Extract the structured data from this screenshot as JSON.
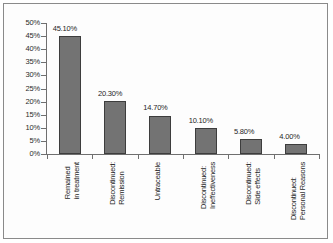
{
  "chart_data": {
    "type": "bar",
    "title": "",
    "subtitle": "",
    "xlabel": "",
    "ylabel": "",
    "ylim": [
      0,
      50
    ],
    "ytick_values": [
      0,
      5,
      10,
      15,
      20,
      25,
      30,
      35,
      40,
      45,
      50
    ],
    "ytick_labels": [
      "0%",
      "5%",
      "10%",
      "15%",
      "20%",
      "25%",
      "30%",
      "35%",
      "40%",
      "45%",
      "50%"
    ],
    "grid": false,
    "legend": "none",
    "bar_color": "#737373",
    "bar_border_color": "#3d3d3d",
    "axis_color": "#6f6f6f",
    "categories": [
      "Remained in treatment",
      "Discontinued: Remission",
      "Untraceable",
      "Discontinued: Ineffectiveness",
      "Discontinued: Side effects",
      "Discontinued: Personal Reasons"
    ],
    "category_lines": [
      [
        "Remained",
        "in treatment"
      ],
      [
        "Discontinued:",
        "Remission"
      ],
      [
        "Untraceable"
      ],
      [
        "Discontinued:",
        "Ineffectiveness"
      ],
      [
        "Discontinued:",
        "Side effects"
      ],
      [
        "Discontinued:",
        "Personal Reasons"
      ]
    ],
    "values": [
      45.1,
      20.3,
      14.7,
      10.1,
      5.8,
      4.0
    ],
    "data_labels": [
      "45.10%",
      "20.30%",
      "14.70%",
      "10.10%",
      "5.80%",
      "4.00%"
    ]
  }
}
